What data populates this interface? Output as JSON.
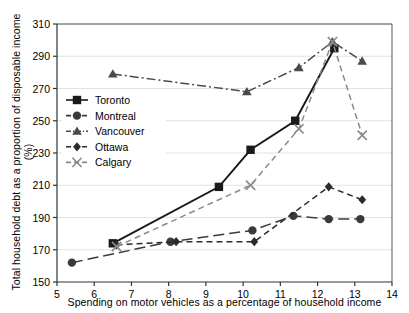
{
  "chart_data": {
    "type": "line",
    "title": "",
    "xlabel": "Spending on motor vehicles as a percentage of household income",
    "ylabel": "Total household debt as a proportion of disposable income (%)",
    "xlim": [
      5,
      14
    ],
    "ylim": [
      150,
      310
    ],
    "xticks": [
      5,
      6,
      7,
      8,
      9,
      10,
      11,
      12,
      13,
      14
    ],
    "yticks": [
      150,
      170,
      190,
      210,
      230,
      250,
      270,
      290,
      310
    ],
    "grid": true,
    "legend_position": "upper-left-inside",
    "series": [
      {
        "name": "Toronto",
        "marker": "square",
        "dash": "solid",
        "color": "#1a1a1a",
        "points": [
          {
            "x": 6.5,
            "y": 174
          },
          {
            "x": 9.35,
            "y": 209
          },
          {
            "x": 10.2,
            "y": 232
          },
          {
            "x": 11.4,
            "y": 250
          },
          {
            "x": 12.45,
            "y": 295
          }
        ]
      },
      {
        "name": "Montreal",
        "marker": "circle",
        "dash": "longdash",
        "color": "#3a3a3a",
        "points": [
          {
            "x": 5.4,
            "y": 162
          },
          {
            "x": 8.05,
            "y": 175
          },
          {
            "x": 10.25,
            "y": 182
          },
          {
            "x": 11.35,
            "y": 191
          },
          {
            "x": 12.3,
            "y": 189
          },
          {
            "x": 13.15,
            "y": 189
          }
        ]
      },
      {
        "name": "Vancouver",
        "marker": "triangle",
        "dash": "dashdot",
        "color": "#4a4a4a",
        "points": [
          {
            "x": 6.5,
            "y": 279
          },
          {
            "x": 10.1,
            "y": 268
          },
          {
            "x": 11.5,
            "y": 283
          },
          {
            "x": 12.4,
            "y": 299
          },
          {
            "x": 13.2,
            "y": 287
          }
        ]
      },
      {
        "name": "Ottawa",
        "marker": "diamond",
        "dash": "dash",
        "color": "#2b2b2b",
        "points": [
          {
            "x": 6.6,
            "y": 173
          },
          {
            "x": 8.2,
            "y": 175
          },
          {
            "x": 10.3,
            "y": 175
          },
          {
            "x": 12.3,
            "y": 209
          },
          {
            "x": 13.2,
            "y": 201
          }
        ]
      },
      {
        "name": "Calgary",
        "marker": "x",
        "dash": "dash",
        "color": "#8a8a8a",
        "points": [
          {
            "x": 6.6,
            "y": 172
          },
          {
            "x": 10.2,
            "y": 210
          },
          {
            "x": 11.5,
            "y": 245
          },
          {
            "x": 12.4,
            "y": 299
          },
          {
            "x": 13.2,
            "y": 241
          }
        ]
      }
    ]
  },
  "legend": {
    "items": [
      {
        "label": "Toronto"
      },
      {
        "label": "Montreal"
      },
      {
        "label": "Vancouver"
      },
      {
        "label": "Ottawa"
      },
      {
        "label": "Calgary"
      }
    ]
  }
}
